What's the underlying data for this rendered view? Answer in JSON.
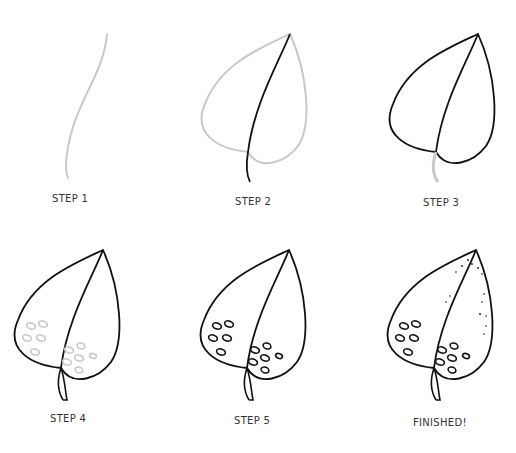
{
  "colors": {
    "ink": "#111111",
    "guide": "#c8c8c8",
    "label": "#333333",
    "background": "#ffffff"
  },
  "steps": [
    {
      "label": "STEP 1",
      "description": "Curved guide line for the main vein"
    },
    {
      "label": "STEP 2",
      "description": "Ink the midrib and sketch the leaf outline in light pencil"
    },
    {
      "label": "STEP 3",
      "description": "Ink the leaf outline; stem sketched"
    },
    {
      "label": "STEP 4",
      "description": "Ink the stem; sketch oval spots"
    },
    {
      "label": "STEP 5",
      "description": "Ink the oval spots"
    },
    {
      "label": "FINISHED!",
      "description": "Add stippling dots near the tip"
    }
  ]
}
